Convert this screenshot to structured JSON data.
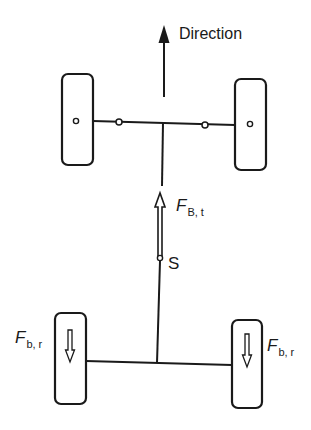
{
  "diagram": {
    "direction_label": "Direction",
    "force_front_label": {
      "symbol": "F",
      "subscript": "B, t"
    },
    "center_point_label": "S",
    "force_rear_left_label": {
      "symbol": "F",
      "subscript": "b, r"
    },
    "force_rear_right_label": {
      "symbol": "F",
      "subscript": "b, r"
    },
    "colors": {
      "stroke": "#1a1a1a",
      "background": "#ffffff"
    }
  }
}
